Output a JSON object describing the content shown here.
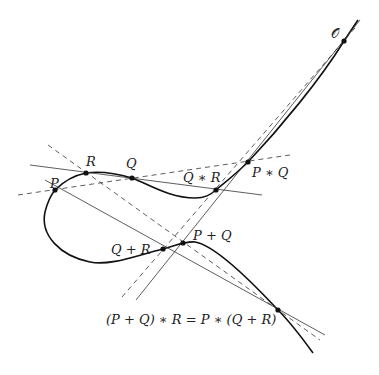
{
  "diagram": {
    "colors": {
      "curve": "#111111",
      "line": "#333333",
      "point": "#111111",
      "background": "#ffffff"
    },
    "points": [
      {
        "id": "O",
        "label": "𝒪",
        "x": 344,
        "y": 41
      },
      {
        "id": "PstarQ",
        "label": "P ∗ Q",
        "x": 248,
        "y": 162
      },
      {
        "id": "QstarR",
        "label": "Q ∗ R",
        "x": 216,
        "y": 190
      },
      {
        "id": "R",
        "label": "R",
        "x": 86,
        "y": 173
      },
      {
        "id": "Q",
        "label": "Q",
        "x": 132,
        "y": 178
      },
      {
        "id": "P",
        "label": "P",
        "x": 55,
        "y": 190
      },
      {
        "id": "PplusQ",
        "label": "P + Q",
        "x": 183,
        "y": 243
      },
      {
        "id": "QplusR",
        "label": "Q + R",
        "x": 163,
        "y": 249
      },
      {
        "id": "assoc",
        "label": "(P + Q) ∗ R = P ∗ (Q + R)",
        "x": 278,
        "y": 310
      }
    ]
  }
}
